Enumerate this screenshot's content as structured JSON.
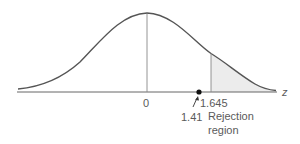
{
  "diagram": {
    "type": "normal-distribution-rejection-region",
    "axis_label": "z",
    "center_label": "0",
    "critical_value_label": "1.645",
    "test_statistic_label": "1.41",
    "region_label_line1": "Rejection",
    "region_label_line2": "region",
    "colors": {
      "curve": "#555555",
      "axis": "#666666",
      "shade": "#ececec",
      "dot": "#111111"
    }
  }
}
